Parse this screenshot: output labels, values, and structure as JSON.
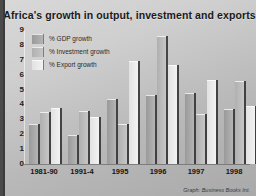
{
  "chart_data": {
    "type": "bar",
    "title": "Africa's growth in output, investment and exports",
    "xlabel": "",
    "ylabel": "",
    "ylim": [
      0,
      9
    ],
    "yticks": [
      0,
      1,
      2,
      3,
      4,
      5,
      6,
      7,
      8,
      9
    ],
    "grid": false,
    "legend_position": "top-left",
    "categories": [
      "1981-90",
      "1991-4",
      "1995",
      "1996",
      "1997",
      "1998"
    ],
    "series": [
      {
        "name": "% GDP growth",
        "values": [
          2.6,
          1.9,
          4.3,
          4.6,
          4.7,
          3.6
        ]
      },
      {
        "name": "% Investment growth",
        "values": [
          3.4,
          3.5,
          2.6,
          8.5,
          3.3,
          5.5
        ]
      },
      {
        "name": "% Export growth",
        "values": [
          3.7,
          3.1,
          6.85,
          6.6,
          5.6,
          3.85
        ]
      }
    ],
    "credit": "Graph: Business Books Int."
  }
}
